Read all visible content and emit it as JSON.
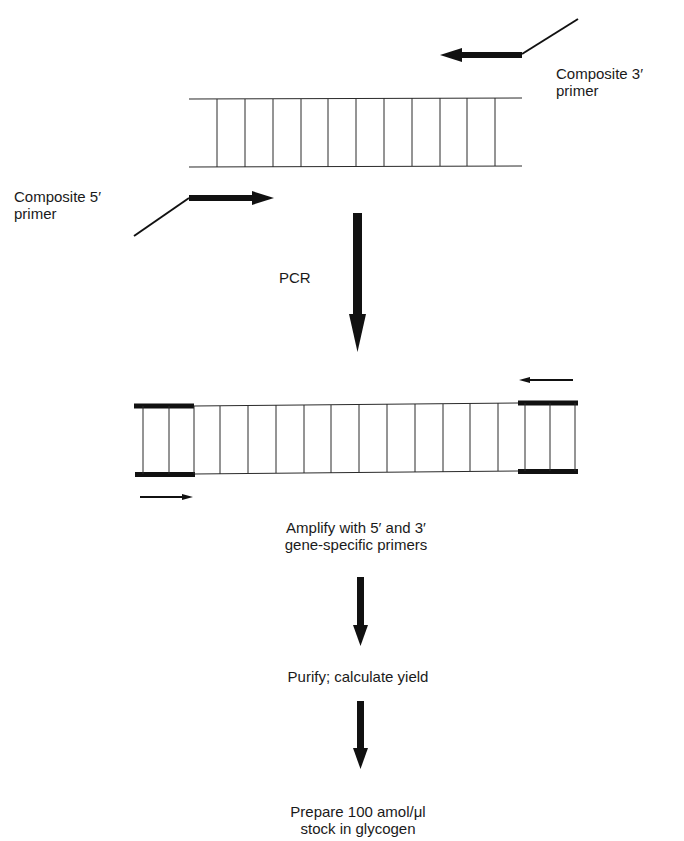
{
  "figure": {
    "type": "PCR amplification workflow schematic",
    "colors": {
      "ink": "#111111",
      "background": "#ffffff"
    }
  },
  "labels": {
    "composite_3_primer": [
      "Composite 3′",
      "primer"
    ],
    "composite_5_primer": [
      "Composite 5′",
      "primer"
    ],
    "pcr": "PCR",
    "step_amplify": [
      "Amplify with 5′ and 3′",
      "gene-specific primers"
    ],
    "step_purify": "Purify; calculate yield",
    "step_prepare": [
      "Prepare 100 amol/μl",
      "stock in glycogen"
    ]
  },
  "template_dna": {
    "rungs": 11
  },
  "pcr_product": {
    "rungs": 16,
    "thick_end_segments": 2
  },
  "workflow_steps": [
    "PCR",
    "Amplify with 5′ and 3′ gene-specific primers",
    "Purify; calculate yield",
    "Prepare 100 amol/μl stock in glycogen"
  ]
}
